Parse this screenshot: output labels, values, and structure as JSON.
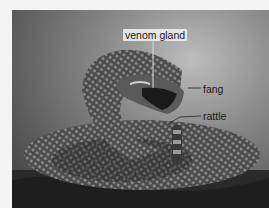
{
  "figure": {
    "labels": [
      {
        "id": "venom-gland",
        "text": "venom gland"
      },
      {
        "id": "fang",
        "text": "fang"
      },
      {
        "id": "rattle",
        "text": "rattle"
      }
    ]
  },
  "colors": {
    "background": "#f4f4f4",
    "label_text": "#1a1a1a",
    "label_box": "#ebebeb"
  }
}
